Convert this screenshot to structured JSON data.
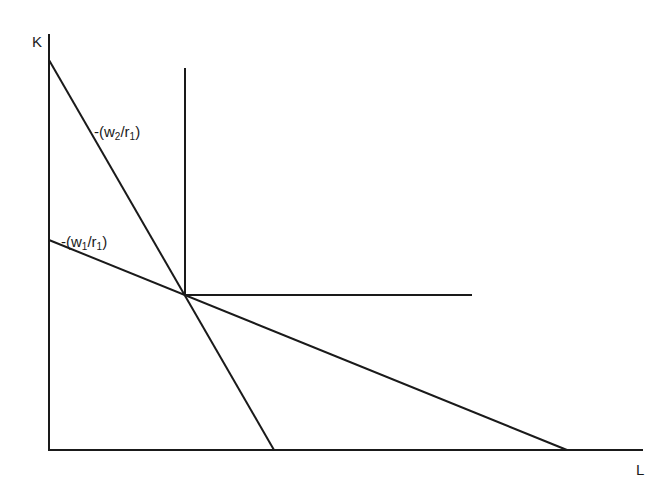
{
  "diagram": {
    "title": "",
    "axes": {
      "y_label": "K",
      "x_label": "L"
    },
    "lines": [
      {
        "id": "isocost-steep",
        "label_prefix": "-(w",
        "label_sub1": "2",
        "label_mid": "/r",
        "label_sub2": "1",
        "label_suffix": ")",
        "label_text": "-(w2/r1)"
      },
      {
        "id": "isocost-flat",
        "label_prefix": "-(w",
        "label_sub1": "1",
        "label_mid": "/r",
        "label_sub2": "1",
        "label_suffix": ")",
        "label_text": "-(w1/r1)"
      }
    ],
    "isoquant": {
      "type": "L-shaped (fixed proportions)"
    },
    "colors": {
      "line": "#1a1a1a",
      "background": "#ffffff"
    }
  }
}
